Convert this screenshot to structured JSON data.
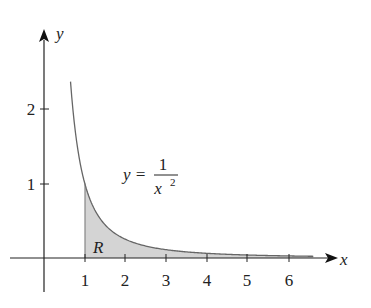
{
  "figure": {
    "type": "function-graph",
    "function_label": {
      "lhs": "y =",
      "numerator": "1",
      "denominator": "x",
      "exponent": "2"
    },
    "region_label": "R",
    "axis_labels": {
      "x": "x",
      "y": "y"
    },
    "x_ticks": [
      "1",
      "2",
      "3",
      "4",
      "5",
      "6"
    ],
    "y_ticks": [
      "1",
      "2"
    ],
    "shaded_region": {
      "from_x": 1,
      "to_x": 6.6,
      "under": "y = 1/x^2"
    },
    "curve_domain": [
      0.65,
      6.6
    ],
    "colors": {
      "curve": "#555555",
      "fill": "#d0d0d0",
      "axes": "#222222"
    }
  }
}
